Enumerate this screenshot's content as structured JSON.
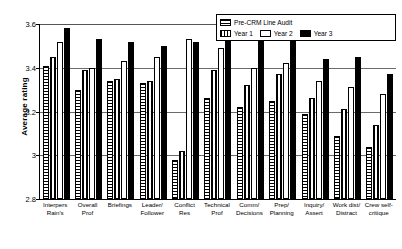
{
  "chart_data": {
    "type": "bar",
    "title": "",
    "xlabel": "",
    "ylabel": "Average rating",
    "ylim": [
      2.8,
      3.6
    ],
    "yticks": [
      "2.8",
      "3",
      "3.2",
      "3.4",
      "3.6"
    ],
    "grid": true,
    "legend_position": "top-right",
    "categories": [
      "Interpers Rain's",
      "Overall Prof",
      "Briefings",
      "Leader/ Follower",
      "Conflict Res",
      "Technical Prof",
      "Comm/ Decisions",
      "Prep/ Planning",
      "Inquiry/ Assert",
      "Work dist/ Distract",
      "Crew self- critique"
    ],
    "category_lines": [
      [
        "Interpers",
        "Rain's"
      ],
      [
        "Overall",
        "Prof"
      ],
      [
        "Briefings",
        ""
      ],
      [
        "Leader/",
        "Follower"
      ],
      [
        "Conflict",
        "Res"
      ],
      [
        "Technical",
        "Prof"
      ],
      [
        "Comm/",
        "Decisions"
      ],
      [
        "Prep/",
        "Planning"
      ],
      [
        "Inquiry/",
        "Assert"
      ],
      [
        "Work dist/",
        "Distract"
      ],
      [
        "Crew self-",
        "critique"
      ]
    ],
    "series": [
      {
        "name": "Pre-CRM Line Audit",
        "pattern": "horizontal-lines",
        "values": [
          3.41,
          3.3,
          3.34,
          3.33,
          2.98,
          3.26,
          3.22,
          3.25,
          3.19,
          3.09,
          3.04
        ]
      },
      {
        "name": "Year 1",
        "pattern": "vertical-lines",
        "values": [
          3.45,
          3.39,
          3.35,
          3.34,
          3.02,
          3.39,
          3.32,
          3.37,
          3.26,
          3.21,
          3.14
        ]
      },
      {
        "name": "Year 2",
        "pattern": "white",
        "values": [
          3.52,
          3.4,
          3.43,
          3.45,
          3.53,
          3.49,
          3.4,
          3.42,
          3.34,
          3.31,
          3.28
        ]
      },
      {
        "name": "Year 3",
        "pattern": "black",
        "values": [
          3.58,
          3.53,
          3.52,
          3.5,
          3.52,
          3.54,
          3.55,
          3.56,
          3.44,
          3.45,
          3.37
        ]
      }
    ]
  },
  "legend": {
    "items": [
      {
        "label": "Pre-CRM Line Audit",
        "swatch": "horizontal-lines"
      },
      {
        "label": "Year 1",
        "swatch": "vertical-lines"
      },
      {
        "label": "Year 2",
        "swatch": "white"
      },
      {
        "label": "Year 3",
        "swatch": "black"
      }
    ]
  }
}
